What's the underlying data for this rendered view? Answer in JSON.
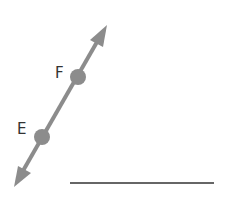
{
  "diagram": {
    "type": "line-through-points",
    "line_color": "#8c8c8c",
    "point_color": "#8c8c8c",
    "answer_line_color": "#333333",
    "points": [
      {
        "label": "F",
        "x": 78,
        "y": 77
      },
      {
        "label": "E",
        "x": 42,
        "y": 137
      }
    ],
    "line": {
      "x1": 14,
      "y1": 187,
      "x2": 107,
      "y2": 25,
      "arrows": "both"
    },
    "answer_blank": {
      "x1": 70,
      "y1": 183,
      "x2": 214,
      "y2": 183
    }
  }
}
